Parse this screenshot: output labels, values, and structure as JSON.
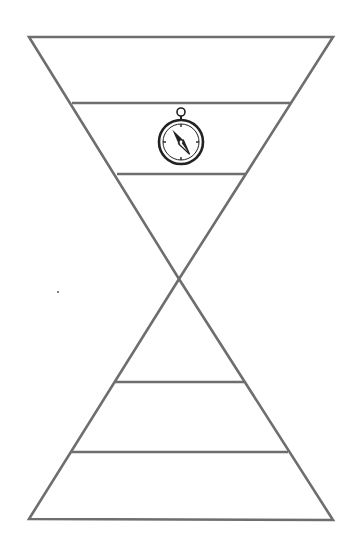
{
  "diagram": {
    "type": "hourglass-funnel",
    "stroke_color": "#6e6e6e",
    "background": "#ffffff",
    "top_funnel": {
      "bands": 3,
      "icon_band": 2,
      "icon": "compass-icon"
    },
    "bottom_pyramid": {
      "bands": 3
    },
    "labels": []
  }
}
